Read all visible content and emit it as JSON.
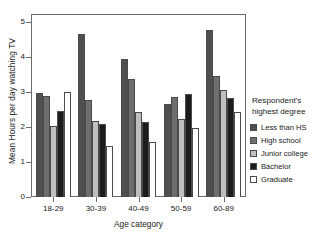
{
  "chart_data": {
    "type": "bar",
    "title": "",
    "xlabel": "Age category",
    "ylabel": "Mean Hours per day watching TV",
    "categories": [
      "18-29",
      "30-39",
      "40-49",
      "50-59",
      "60-89"
    ],
    "ylim": [
      0,
      5.2
    ],
    "yticks": [
      0,
      1,
      2,
      3,
      4,
      5
    ],
    "ytick_labels": [
      "0",
      "1",
      "2",
      "3",
      "4",
      "5"
    ],
    "grid": false,
    "legend_position": "right",
    "legend_title": "Respondent's highest degree",
    "series": [
      {
        "name": "Less than HS",
        "color": "#4f4f4f",
        "values": [
          2.97,
          4.67,
          3.95,
          2.67,
          4.78
        ]
      },
      {
        "name": "High school",
        "color": "#6e6e6e",
        "values": [
          2.9,
          2.77,
          3.38,
          2.85,
          3.47
        ]
      },
      {
        "name": "Junior college",
        "color": "#bfbfbf",
        "values": [
          2.02,
          2.18,
          2.42,
          2.22,
          3.05
        ]
      },
      {
        "name": "Bachelor",
        "color": "#1c1c1c",
        "values": [
          2.45,
          2.08,
          2.15,
          2.95,
          2.83
        ]
      },
      {
        "name": "Graduate",
        "color": "#ffffff",
        "values": [
          3.01,
          1.46,
          1.58,
          1.98,
          2.43
        ]
      }
    ]
  },
  "legend": {
    "title_line_1": "Respondent's",
    "title_line_2": "highest degree"
  }
}
